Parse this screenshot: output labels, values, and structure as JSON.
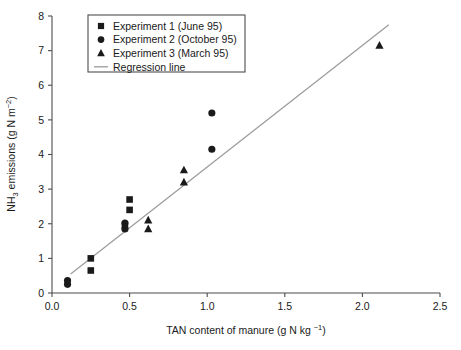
{
  "chart_data": {
    "type": "scatter",
    "title": "",
    "xlabel": "TAN content of manure (g N kg −1)",
    "ylabel": "NH3 emissions (g N m−2)",
    "xlim": [
      0.0,
      2.5
    ],
    "ylim": [
      0,
      8
    ],
    "xticks": [
      "0.0",
      "0.5",
      "1.0",
      "1.5",
      "2.0",
      "2.5"
    ],
    "xtick_values": [
      0.0,
      0.5,
      1.0,
      1.5,
      2.0,
      2.5
    ],
    "yticks": [
      "0",
      "1",
      "2",
      "3",
      "4",
      "5",
      "6",
      "7",
      "8"
    ],
    "ytick_values": [
      0,
      1,
      2,
      3,
      4,
      5,
      6,
      7,
      8
    ],
    "grid": false,
    "legend_position": "top-left",
    "marker_color": "#1a1a1a",
    "line_color": "#9a9a9a",
    "axis_color": "#4d4d4d",
    "series": [
      {
        "name": "Experiment 1 (June 95)",
        "marker": "square",
        "points": [
          [
            0.25,
            1.0
          ],
          [
            0.25,
            0.65
          ],
          [
            0.5,
            2.7
          ],
          [
            0.5,
            2.4
          ],
          [
            0.47,
            1.95
          ]
        ]
      },
      {
        "name": "Experiment 2 (October 95)",
        "marker": "circle",
        "points": [
          [
            0.1,
            0.36
          ],
          [
            0.1,
            0.25
          ],
          [
            0.47,
            2.02
          ],
          [
            0.47,
            1.85
          ],
          [
            1.03,
            5.2
          ],
          [
            1.03,
            4.15
          ]
        ]
      },
      {
        "name": "Experiment 3 (March 95)",
        "marker": "triangle",
        "points": [
          [
            0.62,
            2.1
          ],
          [
            0.62,
            1.85
          ],
          [
            0.85,
            3.55
          ],
          [
            0.85,
            3.2
          ],
          [
            2.11,
            7.15
          ]
        ]
      },
      {
        "name": "Regression line",
        "marker": "line",
        "line": [
          [
            0.12,
            0.55
          ],
          [
            2.17,
            7.75
          ]
        ]
      }
    ],
    "legend_entries": [
      {
        "label": "Experiment 1 (June 95)",
        "marker": "square"
      },
      {
        "label": "Experiment 2 (October 95)",
        "marker": "circle"
      },
      {
        "label": "Experiment 3 (March 95)",
        "marker": "triangle"
      },
      {
        "label": "Regression line",
        "marker": "line"
      }
    ],
    "ylabel_parts": {
      "pre": "NH",
      "sub": "3",
      "mid": " emissions (g N m",
      "sup": "−2",
      "post": ")"
    },
    "xlabel_parts": {
      "pre": "TAN content of manure (g N kg ",
      "sup": "−1",
      "post": ")"
    }
  }
}
